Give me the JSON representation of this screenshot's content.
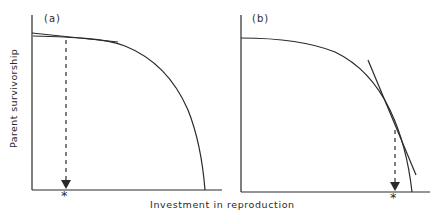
{
  "figure": {
    "panels": [
      {
        "id": "a",
        "label": "(a)",
        "optimum_marker": "*",
        "description": "Concave trade-off curve; tangent touches near the top-left, optimum at low investment"
      },
      {
        "id": "b",
        "label": "(b)",
        "optimum_marker": "*",
        "description": "Concave trade-off curve; steep tangent touches near the lower right, optimum at high investment"
      }
    ],
    "x_axis_label": "Investment in reproduction",
    "y_axis_label": "Parent survivorship",
    "colors": {
      "line": "#2a2a2a",
      "background": "#ffffff"
    }
  }
}
